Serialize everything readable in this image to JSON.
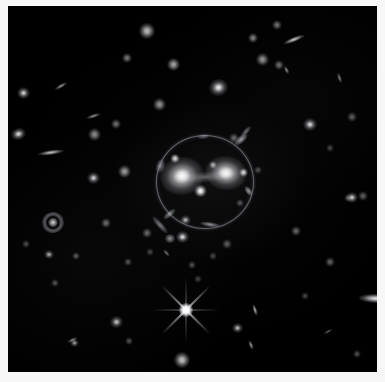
{
  "image": {
    "kind": "astronomical-deep-field",
    "subject": "galaxy-cluster-core-with-gravitational-lens",
    "background_color": "#000000",
    "frame_color": "#f7f7f7",
    "width": 385,
    "height": 382,
    "sky_left": 8,
    "sky_top": 6,
    "sky_width": 369,
    "sky_height": 366
  },
  "einstein_ring": {
    "label": "einstein-ring",
    "center_x": 204,
    "center_y": 181,
    "radius_x": 48,
    "radius_y": 46,
    "stroke_color": "#cdd0da",
    "bright_segments": [
      {
        "label": "arc-upper-right",
        "x": 241,
        "y": 139,
        "w": 16,
        "h": 7,
        "rot": -40,
        "opacity": 0.8
      },
      {
        "label": "arc-right",
        "x": 248,
        "y": 191,
        "w": 11,
        "h": 6,
        "rot": 55,
        "opacity": 0.75
      },
      {
        "label": "arc-lower",
        "x": 210,
        "y": 224,
        "w": 20,
        "h": 5,
        "rot": 8,
        "opacity": 0.7
      },
      {
        "label": "arc-lower-left",
        "x": 169,
        "y": 214,
        "w": 15,
        "h": 6,
        "rot": -40,
        "opacity": 0.65
      },
      {
        "label": "arc-left",
        "x": 160,
        "y": 166,
        "w": 9,
        "h": 14,
        "rot": 15,
        "opacity": 0.55
      },
      {
        "label": "arc-top",
        "x": 203,
        "y": 136,
        "w": 13,
        "h": 5,
        "rot": -6,
        "opacity": 0.45
      }
    ]
  },
  "central_galaxies": [
    {
      "label": "brightest-cluster-galaxy-west",
      "x": 182,
      "y": 176,
      "w": 44,
      "h": 38,
      "rot": -10,
      "brightness": 1.0
    },
    {
      "label": "brightest-cluster-galaxy-east",
      "x": 226,
      "y": 173,
      "w": 42,
      "h": 34,
      "rot": 6,
      "brightness": 0.98
    },
    {
      "label": "compact-companion-center",
      "x": 200,
      "y": 191,
      "w": 13,
      "h": 12,
      "rot": 0,
      "brightness": 0.95
    },
    {
      "label": "compact-companion-north",
      "x": 175,
      "y": 158,
      "w": 10,
      "h": 9,
      "rot": 0,
      "brightness": 0.8
    },
    {
      "label": "compact-companion-east",
      "x": 243,
      "y": 172,
      "w": 9,
      "h": 9,
      "rot": 0,
      "brightness": 0.78
    },
    {
      "label": "compact-companion-northeast",
      "x": 213,
      "y": 165,
      "w": 8,
      "h": 8,
      "rot": 0,
      "brightness": 0.6
    }
  ],
  "tidal_bridge": {
    "label": "tidal-bridge",
    "x": 205,
    "y": 177,
    "w": 46,
    "h": 10,
    "rot": -4
  },
  "foreground_star": {
    "label": "foreground-star-with-diffraction-spikes",
    "x": 186,
    "y": 310,
    "core_size": 14,
    "spike_length": 34,
    "spike_width": 2
  },
  "spiral_galaxy": {
    "label": "face-on-ringed-spiral-galaxy",
    "x": 53,
    "y": 222,
    "w": 22,
    "h": 21,
    "rot": -15
  },
  "edge_on_galaxies": [
    {
      "label": "edge-on-galaxy-right-edge",
      "x": 376,
      "y": 298,
      "w": 34,
      "h": 9,
      "rot": 2,
      "brightness": 0.95
    },
    {
      "label": "edge-on-galaxy-west",
      "x": 51,
      "y": 152,
      "w": 26,
      "h": 5,
      "rot": -8,
      "brightness": 0.78
    },
    {
      "label": "edge-on-galaxy-upper-right",
      "x": 294,
      "y": 39,
      "w": 22,
      "h": 5,
      "rot": -22,
      "brightness": 0.82
    },
    {
      "label": "edge-on-galaxy-northwest",
      "x": 61,
      "y": 86,
      "w": 14,
      "h": 4,
      "rot": -30,
      "brightness": 0.6
    },
    {
      "label": "edge-on-galaxy-north-central",
      "x": 93,
      "y": 116,
      "w": 15,
      "h": 4,
      "rot": -18,
      "brightness": 0.58
    },
    {
      "label": "edge-on-galaxy-east",
      "x": 286,
      "y": 70,
      "w": 9,
      "h": 4,
      "rot": 62,
      "brightness": 0.55
    },
    {
      "label": "edge-on-galaxy-southeast",
      "x": 255,
      "y": 310,
      "w": 12,
      "h": 4,
      "rot": 72,
      "brightness": 0.7
    },
    {
      "label": "edge-on-galaxy-south",
      "x": 251,
      "y": 345,
      "w": 10,
      "h": 4,
      "rot": 68,
      "brightness": 0.62
    },
    {
      "label": "edge-on-galaxy-far-east",
      "x": 339,
      "y": 78,
      "w": 11,
      "h": 4,
      "rot": 70,
      "brightness": 0.5
    },
    {
      "label": "edge-on-galaxy-lower-left",
      "x": 72,
      "y": 340,
      "w": 11,
      "h": 4,
      "rot": -25,
      "brightness": 0.5
    },
    {
      "label": "edge-on-galaxy-southwest",
      "x": 166,
      "y": 253,
      "w": 9,
      "h": 4,
      "rot": 48,
      "brightness": 0.45
    },
    {
      "label": "edge-on-galaxy-mid-east",
      "x": 328,
      "y": 331,
      "w": 10,
      "h": 3,
      "rot": -30,
      "brightness": 0.4
    }
  ],
  "field_galaxies": [
    {
      "label": "elliptical-galaxy-upper-right",
      "x": 218,
      "y": 87,
      "w": 19,
      "h": 17,
      "rot": -12,
      "brightness": 0.92
    },
    {
      "label": "elliptical-galaxy-northwest",
      "x": 23,
      "y": 93,
      "w": 13,
      "h": 12,
      "rot": 0,
      "brightness": 0.82
    },
    {
      "label": "elliptical-galaxy-west",
      "x": 18,
      "y": 134,
      "w": 15,
      "h": 12,
      "rot": -15,
      "brightness": 0.85
    },
    {
      "label": "elliptical-galaxy-east",
      "x": 310,
      "y": 124,
      "w": 14,
      "h": 13,
      "rot": 0,
      "brightness": 0.84
    },
    {
      "label": "elliptical-galaxy-far-east",
      "x": 352,
      "y": 197,
      "w": 12,
      "h": 11,
      "rot": 0,
      "brightness": 0.8
    },
    {
      "label": "elliptical-galaxy-south-central",
      "x": 182,
      "y": 237,
      "w": 13,
      "h": 12,
      "rot": 0,
      "brightness": 0.86
    },
    {
      "label": "elliptical-galaxy-southwest",
      "x": 93,
      "y": 178,
      "w": 13,
      "h": 12,
      "rot": 0,
      "brightness": 0.8
    },
    {
      "label": "elliptical-galaxy-lower-left",
      "x": 49,
      "y": 254,
      "w": 10,
      "h": 9,
      "rot": 0,
      "brightness": 0.68
    },
    {
      "label": "elliptical-galaxy-bottom-center",
      "x": 116,
      "y": 322,
      "w": 13,
      "h": 12,
      "rot": -10,
      "brightness": 0.76
    },
    {
      "label": "elliptical-galaxy-bottom-east",
      "x": 237,
      "y": 328,
      "w": 11,
      "h": 10,
      "rot": 0,
      "brightness": 0.72
    },
    {
      "label": "elliptical-galaxy-south-arc",
      "x": 185,
      "y": 220,
      "w": 11,
      "h": 10,
      "rot": 0,
      "brightness": 0.7
    },
    {
      "label": "elliptical-galaxy-bottom-left",
      "x": 74,
      "y": 343,
      "w": 9,
      "h": 8,
      "rot": 0,
      "brightness": 0.62
    }
  ],
  "point_sources": [
    {
      "label": "point-source-1",
      "x": 147,
      "y": 31,
      "s": 6,
      "b": 0.7
    },
    {
      "label": "point-source-2",
      "x": 173,
      "y": 64,
      "s": 5,
      "b": 0.62
    },
    {
      "label": "point-source-3",
      "x": 159,
      "y": 104,
      "s": 5,
      "b": 0.55
    },
    {
      "label": "point-source-4",
      "x": 127,
      "y": 58,
      "s": 4,
      "b": 0.45
    },
    {
      "label": "point-source-5",
      "x": 253,
      "y": 38,
      "s": 4,
      "b": 0.48
    },
    {
      "label": "point-source-6",
      "x": 277,
      "y": 25,
      "s": 4,
      "b": 0.42
    },
    {
      "label": "point-source-7",
      "x": 262,
      "y": 59,
      "s": 5,
      "b": 0.55
    },
    {
      "label": "point-source-8",
      "x": 279,
      "y": 65,
      "s": 4,
      "b": 0.4
    },
    {
      "label": "point-source-9",
      "x": 116,
      "y": 124,
      "s": 4,
      "b": 0.42
    },
    {
      "label": "point-source-10",
      "x": 94,
      "y": 134,
      "s": 5,
      "b": 0.52
    },
    {
      "label": "point-source-11",
      "x": 124,
      "y": 171,
      "s": 5,
      "b": 0.58
    },
    {
      "label": "point-source-12",
      "x": 106,
      "y": 223,
      "s": 4,
      "b": 0.4
    },
    {
      "label": "point-source-13",
      "x": 147,
      "y": 233,
      "s": 4,
      "b": 0.38
    },
    {
      "label": "point-source-14",
      "x": 76,
      "y": 256,
      "s": 3,
      "b": 0.32
    },
    {
      "label": "point-source-15",
      "x": 128,
      "y": 262,
      "s": 3,
      "b": 0.3
    },
    {
      "label": "point-source-16",
      "x": 26,
      "y": 244,
      "s": 3,
      "b": 0.28
    },
    {
      "label": "point-source-17",
      "x": 55,
      "y": 283,
      "s": 3,
      "b": 0.3
    },
    {
      "label": "point-source-18",
      "x": 192,
      "y": 265,
      "s": 3,
      "b": 0.3
    },
    {
      "label": "point-source-19",
      "x": 227,
      "y": 244,
      "s": 4,
      "b": 0.34
    },
    {
      "label": "point-source-20",
      "x": 296,
      "y": 231,
      "s": 4,
      "b": 0.38
    },
    {
      "label": "point-source-21",
      "x": 330,
      "y": 262,
      "s": 4,
      "b": 0.36
    },
    {
      "label": "point-source-22",
      "x": 363,
      "y": 196,
      "s": 4,
      "b": 0.36
    },
    {
      "label": "point-source-23",
      "x": 348,
      "y": 198,
      "s": 3,
      "b": 0.28
    },
    {
      "label": "point-source-24",
      "x": 129,
      "y": 341,
      "s": 3,
      "b": 0.3
    },
    {
      "label": "point-source-25",
      "x": 182,
      "y": 360,
      "s": 6,
      "b": 0.72
    },
    {
      "label": "point-source-26",
      "x": 305,
      "y": 296,
      "s": 3,
      "b": 0.26
    },
    {
      "label": "point-source-27",
      "x": 357,
      "y": 354,
      "s": 3,
      "b": 0.3
    },
    {
      "label": "point-source-28",
      "x": 234,
      "y": 138,
      "s": 4,
      "b": 0.38
    },
    {
      "label": "point-source-29",
      "x": 240,
      "y": 203,
      "s": 3,
      "b": 0.3
    },
    {
      "label": "point-source-30",
      "x": 213,
      "y": 256,
      "s": 3,
      "b": 0.26
    },
    {
      "label": "point-source-31",
      "x": 150,
      "y": 252,
      "s": 3,
      "b": 0.26
    },
    {
      "label": "point-source-32",
      "x": 352,
      "y": 117,
      "s": 4,
      "b": 0.34
    },
    {
      "label": "point-source-33",
      "x": 330,
      "y": 148,
      "s": 3,
      "b": 0.26
    },
    {
      "label": "point-source-34",
      "x": 198,
      "y": 279,
      "s": 3,
      "b": 0.24
    },
    {
      "label": "point-source-35",
      "x": 258,
      "y": 170,
      "s": 3,
      "b": 0.28
    }
  ],
  "lensed_arcs_outer": [
    {
      "label": "lensed-arc-southwest-tail",
      "x": 160,
      "y": 225,
      "w": 22,
      "h": 6,
      "rot": 48,
      "opacity": 0.6
    },
    {
      "label": "lensed-arc-southwest-knot",
      "x": 170,
      "y": 238,
      "w": 10,
      "h": 9,
      "rot": 0,
      "opacity": 0.7
    },
    {
      "label": "lensed-arc-north",
      "x": 246,
      "y": 131,
      "w": 14,
      "h": 5,
      "rot": -48,
      "opacity": 0.55
    }
  ]
}
